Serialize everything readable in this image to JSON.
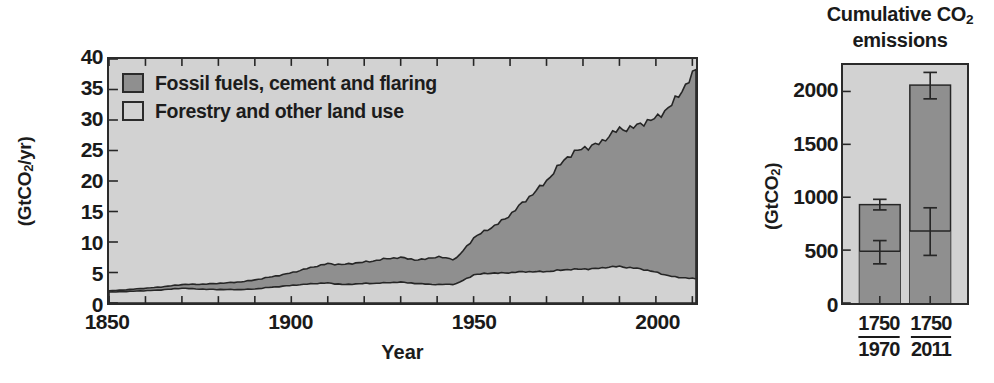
{
  "colors": {
    "fossil_fill": "#8f8f8f",
    "land_fill": "#d2d2d2",
    "axis": "#2b2b2b",
    "text": "#1c1c1c",
    "plot_bg": "#d2d2d2"
  },
  "left": {
    "ylabel": "(GtCO2/yr)",
    "ylabel_html": "(GtCO<sub>2</sub>/yr)",
    "xlabel": "Year",
    "yticks": [
      0,
      5,
      10,
      15,
      20,
      25,
      30,
      35,
      40
    ],
    "xticks": [
      1850,
      1900,
      1950,
      2000
    ],
    "legend": [
      {
        "label": "Fossil fuels, cement and flaring",
        "color": "#8f8f8f"
      },
      {
        "label": "Forestry and other land use",
        "color": "#d2d2d2"
      }
    ]
  },
  "right": {
    "title_line1": "Cumulative CO2",
    "title_line1_html": "Cumulative CO<sub>2</sub>",
    "title_line2": "emissions",
    "ylabel": "(GtCO2)",
    "ylabel_html": "(GtCO<sub>2</sub>)",
    "yticks": [
      0,
      500,
      1000,
      1500,
      2000
    ],
    "xticks": [
      {
        "top": "1750",
        "bottom": "1970"
      },
      {
        "top": "1750",
        "bottom": "2011"
      }
    ]
  },
  "chart_data": [
    {
      "type": "area",
      "id": "annual-co2-emissions",
      "title": "",
      "xlabel": "Year",
      "ylabel": "(GtCO2/yr)",
      "xlim": [
        1850,
        2011
      ],
      "ylim": [
        0,
        40
      ],
      "grid": false,
      "stacked": true,
      "legend_position": "top-left",
      "legend": [
        "Fossil fuels, cement and flaring",
        "Forestry and other land use"
      ],
      "x": [
        1850,
        1855,
        1860,
        1865,
        1870,
        1875,
        1880,
        1885,
        1890,
        1895,
        1900,
        1905,
        1910,
        1915,
        1920,
        1925,
        1930,
        1935,
        1940,
        1945,
        1950,
        1955,
        1960,
        1965,
        1970,
        1975,
        1980,
        1985,
        1990,
        1995,
        2000,
        2005,
        2010,
        2011
      ],
      "series": [
        {
          "name": "Fossil fuels, cement and flaring",
          "units": "GtCO2/yr",
          "values": [
            0.2,
            0.3,
            0.4,
            0.5,
            0.6,
            0.8,
            1.0,
            1.2,
            1.5,
            1.7,
            2.1,
            2.6,
            3.2,
            3.3,
            3.5,
            3.9,
            4.0,
            3.9,
            4.5,
            4.1,
            6.0,
            7.5,
            9.5,
            12.0,
            15.0,
            18.0,
            20.0,
            20.5,
            22.5,
            23.5,
            25.0,
            29.0,
            33.0,
            34.0
          ]
        },
        {
          "name": "Forestry and other land use",
          "units": "GtCO2/yr",
          "values": [
            1.8,
            1.9,
            2.0,
            2.2,
            2.4,
            2.3,
            2.2,
            2.2,
            2.3,
            2.6,
            2.9,
            3.1,
            3.3,
            3.0,
            3.2,
            3.3,
            3.4,
            3.2,
            3.0,
            3.1,
            4.6,
            4.9,
            5.0,
            5.1,
            5.2,
            5.4,
            5.6,
            5.7,
            6.0,
            5.7,
            5.0,
            4.3,
            4.0,
            3.9
          ]
        }
      ],
      "total_note": "Total peaks near 38 GtCO2/yr in 2011"
    },
    {
      "type": "bar",
      "id": "cumulative-co2-emissions",
      "title": "Cumulative CO2 emissions",
      "xlabel": "",
      "ylabel": "(GtCO2)",
      "ylim": [
        0,
        2250
      ],
      "grid": false,
      "stacked": true,
      "categories": [
        "1750–1970",
        "1750–2011"
      ],
      "series": [
        {
          "name": "Fossil fuels, cement and flaring",
          "units": "GtCO2",
          "values": [
            490,
            680
          ]
        },
        {
          "name": "Forestry and other land use",
          "units": "GtCO2",
          "values": [
            440,
            1380
          ]
        }
      ],
      "totals": [
        930,
        2060
      ],
      "errorbars": [
        {
          "category": "1750–1970",
          "level": 490,
          "low": 370,
          "high": 590,
          "role": "split-point"
        },
        {
          "category": "1750–1970",
          "level": 930,
          "low": 880,
          "high": 980,
          "role": "total"
        },
        {
          "category": "1750–2011",
          "level": 680,
          "low": 450,
          "high": 900,
          "role": "split-point"
        },
        {
          "category": "1750–2011",
          "level": 2060,
          "low": 1930,
          "high": 2180,
          "role": "total"
        }
      ]
    }
  ]
}
